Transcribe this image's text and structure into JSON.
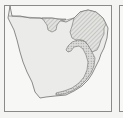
{
  "figure": {
    "panels": [
      {
        "id": "main",
        "subject": "southern-africa-map",
        "regions": [
          {
            "name": "land",
            "style": "solid",
            "fill": "#ebebe9"
          },
          {
            "name": "northeast-region",
            "style": "hatched",
            "fill": "#d8d8d6"
          },
          {
            "name": "north-lobe-region",
            "style": "hatched",
            "fill": "#d8d8d6"
          },
          {
            "name": "east-coast-band",
            "style": "stippled",
            "fill": "#c9c9c7"
          }
        ],
        "colors": {
          "border": "#8a8a88",
          "coastline": "#6e6e6c",
          "background": "#f7f7f5"
        }
      },
      {
        "id": "next",
        "subject": "adjacent-panel-partial"
      }
    ]
  }
}
